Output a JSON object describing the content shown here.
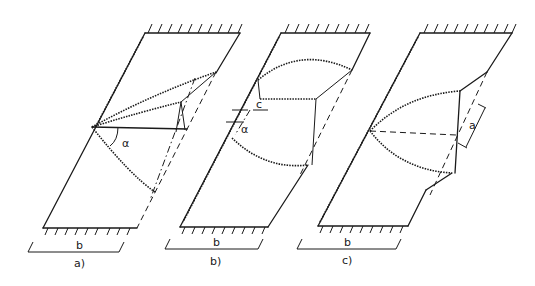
{
  "figure": {
    "panels": [
      {
        "id": "a",
        "caption": "a)",
        "width_label": "b",
        "angle_label": "α"
      },
      {
        "id": "b",
        "caption": "b)",
        "width_label": "b",
        "angle_label": "α",
        "offset_label": "c"
      },
      {
        "id": "c",
        "caption": "c)",
        "width_label": "b",
        "dimension_label": "a"
      }
    ]
  }
}
